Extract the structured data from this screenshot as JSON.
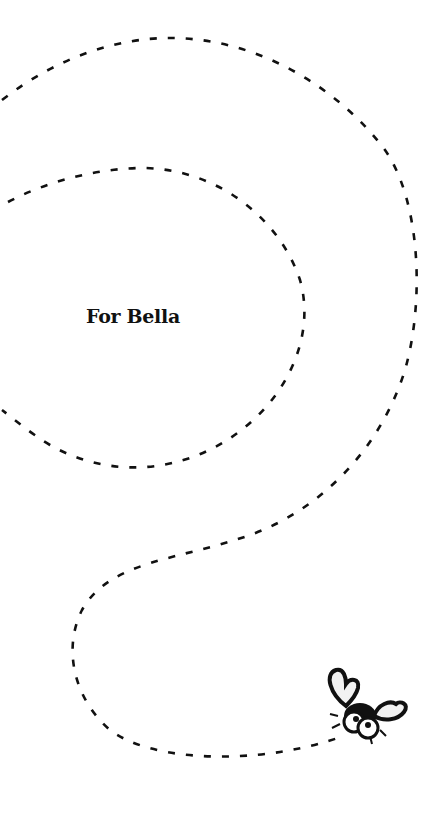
{
  "page": {
    "dedication": "For Bella",
    "illustration": "bug-icon",
    "path_style": "dashed-flight-path"
  },
  "colors": {
    "background": "#ffffff",
    "ink": "#111111",
    "wing_fill": "#f2f2f2"
  }
}
